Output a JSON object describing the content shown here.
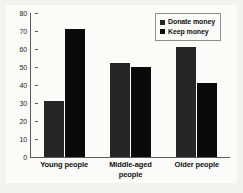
{
  "chart_data": {
    "type": "bar",
    "title": "",
    "subtitle": "",
    "xlabel": "",
    "ylabel": "",
    "ylim": [
      0,
      80
    ],
    "ytick_step": 10,
    "yticks": [
      "80",
      "70",
      "60",
      "50",
      "40",
      "30",
      "20",
      "10",
      "0"
    ],
    "grid": false,
    "legend_position": "top-right",
    "categories": [
      "Young people",
      "Middle-aged people",
      "Older people"
    ],
    "category_lines": [
      [
        "Young people"
      ],
      [
        "Middle-aged",
        "people"
      ],
      [
        "Older people"
      ]
    ],
    "series": [
      {
        "name": "Donate money",
        "color": "#262626",
        "values": [
          31,
          52,
          61
        ]
      },
      {
        "name": "Keep money",
        "color": "#0a0a0a",
        "values": [
          71,
          50,
          41
        ]
      }
    ]
  },
  "legend": {
    "items": [
      {
        "label": "Donate money",
        "swatch": "donate-swatch"
      },
      {
        "label": "Keep money",
        "swatch": "keep-swatch"
      }
    ]
  },
  "colors": {
    "figure_background": "#f2f2f0",
    "plot_background": "#fbfbfa",
    "axis": "#5a5a5a",
    "text": "#111111",
    "legend_border": "#8d8d8d"
  }
}
